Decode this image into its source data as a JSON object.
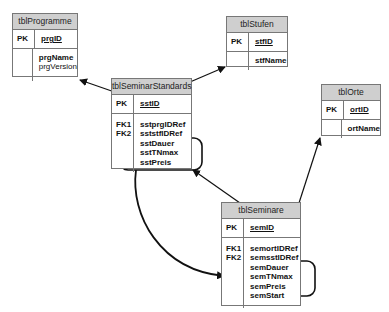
{
  "tables": {
    "programme": {
      "title": "tblProgramme",
      "pk_label": "PK",
      "pk_field": "prgID",
      "fields": [
        "prgName",
        "prgVersion"
      ]
    },
    "stufen": {
      "title": "tblStufen",
      "pk_label": "PK",
      "pk_field": "stfID",
      "fields": [
        "stfName"
      ]
    },
    "standards": {
      "title": "tblSeminarStandards",
      "pk_label": "PK",
      "pk_field": "sstID",
      "fk_labels": [
        "FK1",
        "FK2"
      ],
      "fields": [
        "sstprgIDRef",
        "sststfIDRef",
        "sstDauer",
        "sstTNmax",
        "sstPreis"
      ]
    },
    "orte": {
      "title": "tblOrte",
      "pk_label": "PK",
      "pk_field": "ortID",
      "fields": [
        "ortName"
      ]
    },
    "seminare": {
      "title": "tblSeminare",
      "pk_label": "PK",
      "pk_field": "semID",
      "fk_labels": [
        "FK1",
        "FK2"
      ],
      "fields": [
        "semortIDRef",
        "semsstIDRef",
        "semDauer",
        "semTNmax",
        "semPreis",
        "semStart"
      ]
    }
  },
  "relationships": [
    {
      "from": "tblSeminarStandards",
      "to": "tblProgramme"
    },
    {
      "from": "tblSeminarStandards",
      "to": "tblStufen"
    },
    {
      "from": "tblSeminare",
      "to": "tblSeminarStandards"
    },
    {
      "from": "tblSeminare",
      "to": "tblOrte"
    }
  ],
  "highlights": [
    {
      "table": "tblSeminarStandards",
      "fields": [
        "sstDauer",
        "sstTNmax",
        "sstPreis"
      ]
    },
    {
      "table": "tblSeminare",
      "fields": [
        "semDauer",
        "semTNmax",
        "semPreis"
      ]
    }
  ],
  "copy_arrow": {
    "from": "tblSeminarStandards highlight",
    "to": "tblSeminare highlight"
  },
  "colors": {
    "header_fill": "#cfcfcf",
    "border": "#777777",
    "line": "#111111"
  }
}
